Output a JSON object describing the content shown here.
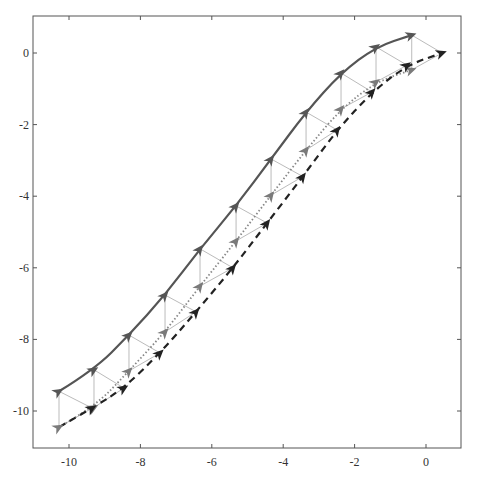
{
  "chart_data": {
    "type": "line",
    "title": "",
    "xlabel": "",
    "ylabel": "",
    "xlim": [
      -10.75,
      1.0
    ],
    "ylim": [
      -11.0,
      1.05
    ],
    "xticks": [
      -10,
      -8,
      -6,
      -4,
      -2,
      0
    ],
    "yticks": [
      0,
      -2,
      -4,
      -6,
      -8,
      -10
    ],
    "xtick_labels": [
      "-10",
      "-8",
      "-6",
      "-4",
      "-2",
      "0"
    ],
    "ytick_labels": [
      "0",
      "-2",
      "-4",
      "-6",
      "-8",
      "-10"
    ],
    "grid": false,
    "legend": null,
    "series": [
      {
        "name": "solid",
        "style": "solid",
        "color": "#555555",
        "marker": "arrowhead",
        "x": [
          -10.28,
          -9.3,
          -8.32,
          -7.31,
          -6.33,
          -5.32,
          -4.34,
          -3.36,
          -2.38,
          -1.4,
          -0.4
        ],
        "y": [
          -9.45,
          -8.85,
          -7.88,
          -6.76,
          -5.47,
          -4.27,
          -2.96,
          -1.65,
          -0.56,
          0.17,
          0.5
        ]
      },
      {
        "name": "dotted",
        "style": "dotted",
        "color": "#888888",
        "marker": "arrowhead",
        "x": [
          -10.28,
          -9.3,
          -8.32,
          -7.31,
          -6.33,
          -5.32,
          -4.34,
          -3.36,
          -2.38,
          -1.4,
          -0.4
        ],
        "y": [
          -10.45,
          -9.9,
          -8.88,
          -7.79,
          -6.51,
          -5.25,
          -3.97,
          -2.71,
          -1.56,
          -0.81,
          -0.47
        ]
      },
      {
        "name": "dashed",
        "style": "dashed",
        "color": "#222222",
        "marker": "arrowhead",
        "x": [
          -9.35,
          -8.46,
          -7.45,
          -6.44,
          -5.41,
          -4.45,
          -3.45,
          -2.49,
          -1.51,
          -0.53,
          0.45
        ],
        "y": [
          -9.92,
          -9.36,
          -8.38,
          -7.23,
          -6.0,
          -4.75,
          -3.45,
          -2.15,
          -1.09,
          -0.34,
          0.0
        ]
      }
    ],
    "connectors": {
      "color": "#bbbbbb",
      "description": "thin lines from each solid marker vertically to dotted marker and diagonally to next dashed marker"
    }
  }
}
